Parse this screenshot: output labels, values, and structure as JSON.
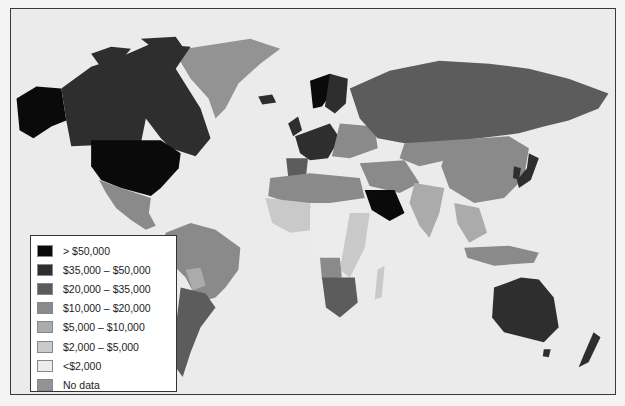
{
  "map": {
    "type": "choropleth",
    "subject": "GDP per capita by country",
    "ocean_color": "#ebebeb",
    "border_color": "#3a3a3a"
  },
  "legend": {
    "items": [
      {
        "label": "> $50,000",
        "color": "#0a0a0a"
      },
      {
        "label": "$35,000 – $50,000",
        "color": "#2e2e2e"
      },
      {
        "label": "$20,000 – $35,000",
        "color": "#5c5c5c"
      },
      {
        "label": "$10,000 – $20,000",
        "color": "#8a8a8a"
      },
      {
        "label": "$5,000 – $10,000",
        "color": "#ababab"
      },
      {
        "label": "$2,000 – $5,000",
        "color": "#c9c9c9"
      },
      {
        "label": "<$2,000",
        "color": "#ececec"
      },
      {
        "label": "No data",
        "color": "#939393"
      }
    ]
  },
  "regions": [
    {
      "name": "United States",
      "class": "> $50,000"
    },
    {
      "name": "Alaska",
      "class": "> $50,000"
    },
    {
      "name": "Canada",
      "class": "$35,000 – $50,000"
    },
    {
      "name": "Greenland",
      "class": "$10,000 – $20,000"
    },
    {
      "name": "Mexico",
      "class": "$10,000 – $20,000"
    },
    {
      "name": "Russia",
      "class": "$20,000 – $35,000"
    },
    {
      "name": "China",
      "class": "$10,000 – $20,000"
    },
    {
      "name": "India",
      "class": "$5,000 – $10,000"
    },
    {
      "name": "Japan",
      "class": "$35,000 – $50,000"
    },
    {
      "name": "Saudi Arabia",
      "class": "> $50,000"
    },
    {
      "name": "Australia",
      "class": "$35,000 – $50,000"
    },
    {
      "name": "New Zealand",
      "class": "$35,000 – $50,000"
    },
    {
      "name": "Brazil",
      "class": "$10,000 – $20,000"
    },
    {
      "name": "Argentina",
      "class": "$20,000 – $35,000"
    },
    {
      "name": "South Africa",
      "class": "$10,000 – $20,000"
    },
    {
      "name": "Norway",
      "class": "> $50,000"
    },
    {
      "name": "Western Europe",
      "class": "$35,000 – $50,000"
    }
  ]
}
